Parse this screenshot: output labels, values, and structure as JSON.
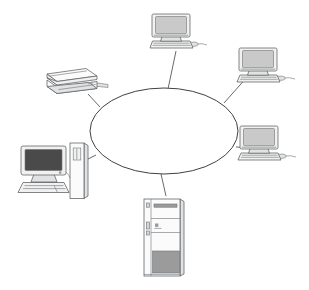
{
  "canvas": {
    "width": 309,
    "height": 290,
    "background_color": "#ffffff",
    "title": "Network topology diagram",
    "description": "Six computing devices connected by lines to a central empty ellipse representing a network"
  },
  "palette": {
    "line_color": "#555a5e",
    "cloud_outline": "#3d4246",
    "device_outline": "#5a5f63",
    "screen_gray": "#c9c9c9",
    "screen_dark": "#4a4a4a",
    "body_light": "#f1f1f1",
    "body_mid": "#e2e2e2",
    "panel_dark": "#9b9b9b"
  },
  "network": {
    "cloud": {
      "shape": "ellipse",
      "label": "",
      "cx": 164,
      "cy": 131,
      "rx": 74,
      "ry": 43,
      "fill": "#ffffff",
      "stroke": "#3d4246"
    },
    "links": [
      {
        "id": "link-top-desktop",
        "from": "cloud",
        "to": "desktop-top",
        "x1": 168,
        "y1": 89,
        "x2": 176,
        "y2": 51
      },
      {
        "id": "link-top-right-pc",
        "from": "cloud",
        "to": "desktop-top-right",
        "x1": 224,
        "y1": 103,
        "x2": 248,
        "y2": 76
      },
      {
        "id": "link-right-pc",
        "from": "cloud",
        "to": "desktop-right",
        "x1": 236,
        "y1": 147,
        "x2": 253,
        "y2": 148
      },
      {
        "id": "link-server",
        "from": "cloud",
        "to": "server-tower",
        "x1": 161,
        "y1": 174,
        "x2": 166,
        "y2": 196
      },
      {
        "id": "link-workstation",
        "from": "cloud",
        "to": "workstation-tower",
        "x1": 96,
        "y1": 155,
        "x2": 80,
        "y2": 163
      },
      {
        "id": "link-printer",
        "from": "cloud",
        "to": "printer",
        "x1": 100,
        "y1": 107,
        "x2": 88,
        "y2": 94
      }
    ]
  },
  "devices": [
    {
      "id": "desktop-top",
      "name": "desktop-computer-top",
      "type": "desktop-computer",
      "parts": [
        "monitor",
        "keyboard",
        "mouse"
      ],
      "position": {
        "x": 147,
        "y": 13,
        "width": 62,
        "height": 38
      }
    },
    {
      "id": "desktop-top-right",
      "name": "desktop-computer-top-right",
      "type": "desktop-computer",
      "parts": [
        "monitor",
        "keyboard",
        "mouse"
      ],
      "position": {
        "x": 234,
        "y": 47,
        "width": 62,
        "height": 38
      }
    },
    {
      "id": "desktop-right",
      "name": "desktop-computer-right",
      "type": "desktop-computer",
      "parts": [
        "monitor",
        "keyboard",
        "mouse"
      ],
      "position": {
        "x": 235,
        "y": 125,
        "width": 62,
        "height": 38
      }
    },
    {
      "id": "server-tower",
      "name": "server-tower-bottom",
      "type": "server-tower",
      "parts": [
        "drive-bay",
        "front-panel",
        "badge",
        "lower-vent-panel"
      ],
      "position": {
        "x": 142,
        "y": 196,
        "width": 42,
        "height": 80
      }
    },
    {
      "id": "workstation-tower",
      "name": "workstation-bottom-left",
      "type": "workstation",
      "parts": [
        "monitor",
        "keyboard",
        "mini-tower",
        "drive-slot"
      ],
      "position": {
        "x": 17,
        "y": 140,
        "width": 75,
        "height": 65
      }
    },
    {
      "id": "printer",
      "name": "laser-printer-top-left",
      "type": "laser-printer",
      "parts": [
        "body",
        "paper-tray",
        "output-tray"
      ],
      "position": {
        "x": 44,
        "y": 68,
        "width": 62,
        "height": 30
      }
    }
  ]
}
